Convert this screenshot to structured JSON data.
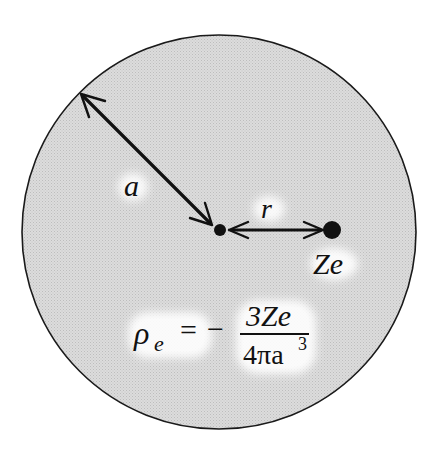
{
  "diagram": {
    "sphere": {
      "fill": "#d9d9d9",
      "stroke": "#1a1a1a",
      "cx": 219,
      "cy": 232,
      "r": 198
    },
    "labels": {
      "radius": "a",
      "distance": "r",
      "nucleus_charge": "Ze"
    },
    "formula": {
      "lhs_symbol": "ρ",
      "lhs_subscript": "e",
      "equals": "=",
      "sign": "−",
      "numerator": "3Ze",
      "denominator_base": "4πa",
      "denominator_exponent": "3"
    },
    "colors": {
      "ink": "#111111",
      "sphere_fill": "#d9d9d9",
      "label_bg": "#ffffff"
    }
  }
}
